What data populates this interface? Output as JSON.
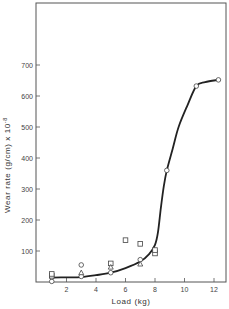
{
  "chart_data": {
    "type": "scatter",
    "title": "",
    "xlabel": "Load (kg)",
    "ylabel": "Wear rate (g/cm) x 10^-8",
    "ylabel_parts": {
      "main": "Wear rate (g/cm) x 10",
      "exp": "-8"
    },
    "xlim": [
      0,
      13
    ],
    "ylim": [
      0,
      900
    ],
    "xticks": [
      2,
      4,
      6,
      8,
      10,
      12
    ],
    "yticks": [
      100,
      200,
      300,
      400,
      500,
      600,
      700
    ],
    "grid": false,
    "legend": null,
    "series": [
      {
        "name": "circles",
        "marker": "circle",
        "points": [
          [
            1,
            2
          ],
          [
            1,
            16
          ],
          [
            3,
            18
          ],
          [
            3,
            55
          ],
          [
            5,
            30
          ],
          [
            7,
            72
          ],
          [
            8,
            100
          ],
          [
            8.8,
            360
          ],
          [
            10.8,
            632
          ],
          [
            12.3,
            652
          ]
        ]
      },
      {
        "name": "squares",
        "marker": "square",
        "points": [
          [
            1,
            20
          ],
          [
            1,
            26
          ],
          [
            5,
            60
          ],
          [
            6,
            135
          ],
          [
            7,
            123
          ],
          [
            8,
            92
          ],
          [
            8,
            103
          ]
        ]
      },
      {
        "name": "triangles",
        "marker": "triangle",
        "points": [
          [
            3,
            30
          ],
          [
            5,
            48
          ],
          [
            7,
            58
          ]
        ]
      }
    ],
    "fitted_curve": {
      "name": "trend",
      "points": [
        [
          1,
          14
        ],
        [
          2,
          15
        ],
        [
          3,
          16
        ],
        [
          4,
          22
        ],
        [
          5,
          30
        ],
        [
          6,
          45
        ],
        [
          7,
          66
        ],
        [
          7.6,
          90
        ],
        [
          8,
          120
        ],
        [
          8.2,
          160
        ],
        [
          8.4,
          240
        ],
        [
          8.6,
          310
        ],
        [
          8.8,
          360
        ],
        [
          9.2,
          430
        ],
        [
          9.6,
          500
        ],
        [
          10.2,
          570
        ],
        [
          10.8,
          632
        ],
        [
          11.4,
          645
        ],
        [
          12.3,
          652
        ]
      ]
    }
  }
}
